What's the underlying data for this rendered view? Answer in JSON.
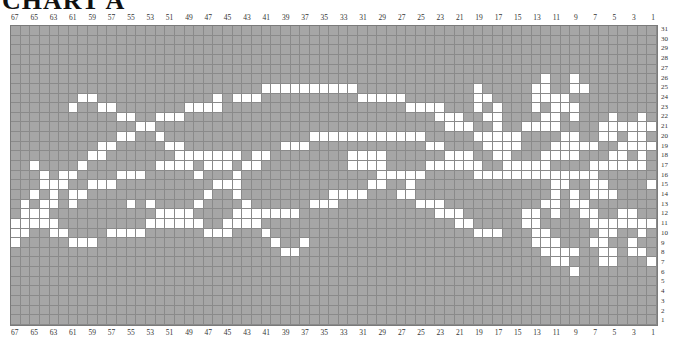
{
  "title": "CHART A",
  "grid": {
    "columns": 67,
    "rows": 31,
    "column_labels": [
      67,
      65,
      63,
      61,
      59,
      57,
      55,
      53,
      51,
      49,
      47,
      45,
      43,
      41,
      39,
      37,
      35,
      33,
      31,
      29,
      27,
      25,
      23,
      21,
      19,
      17,
      15,
      13,
      11,
      9,
      7,
      5,
      3,
      1
    ],
    "row_labels": [
      31,
      30,
      29,
      28,
      27,
      26,
      25,
      24,
      23,
      22,
      21,
      20,
      19,
      18,
      17,
      16,
      15,
      14,
      13,
      12,
      11,
      10,
      9,
      8,
      7,
      6,
      5,
      4,
      3,
      2,
      1
    ],
    "colors": {
      "background": "#a6a6a6",
      "stitch": "#ffffff",
      "gridline": "#8a8a8a"
    },
    "white_cells_by_row": {
      "26": [
        12,
        9
      ],
      "25": [
        41,
        40,
        39,
        38,
        37,
        36,
        35,
        34,
        33,
        32,
        19,
        13,
        12,
        9,
        8
      ],
      "24": [
        60,
        59,
        46,
        44,
        43,
        42,
        31,
        30,
        29,
        28,
        27,
        19,
        18,
        13,
        12,
        11,
        10
      ],
      "23": [
        61,
        58,
        57,
        49,
        48,
        47,
        46,
        26,
        25,
        24,
        23,
        19,
        17,
        13,
        11,
        10,
        9
      ],
      "22": [
        56,
        55,
        52,
        51,
        50,
        23,
        22,
        21,
        18,
        17,
        12,
        11,
        9,
        5,
        2
      ],
      "21": [
        54,
        53,
        22,
        21,
        20,
        17,
        14,
        13,
        12,
        11,
        6,
        5,
        4,
        3,
        2,
        1
      ],
      "20": [
        56,
        55,
        52,
        36,
        35,
        34,
        33,
        32,
        31,
        30,
        29,
        28,
        27,
        26,
        25,
        19,
        18,
        17,
        16,
        15,
        10,
        9,
        6,
        5,
        3,
        2
      ],
      "19": [
        58,
        57,
        51,
        50,
        39,
        38,
        37,
        24,
        23,
        18,
        17,
        16,
        15,
        11,
        10,
        9,
        8,
        7,
        4,
        3,
        2,
        1
      ],
      "18": [
        59,
        58,
        50,
        49,
        48,
        47,
        46,
        45,
        44,
        42,
        41,
        32,
        31,
        30,
        29,
        22,
        21,
        20,
        17,
        16,
        12,
        11,
        10,
        9,
        5,
        4,
        2
      ],
      "17": [
        65,
        60,
        52,
        51,
        50,
        49,
        47,
        46,
        45,
        43,
        42,
        32,
        31,
        30,
        29,
        24,
        23,
        22,
        21,
        20,
        19,
        16,
        15,
        14,
        13,
        12,
        7,
        6,
        5,
        4,
        3,
        2
      ],
      "16": [
        64,
        62,
        61,
        56,
        55,
        54,
        48,
        44,
        29,
        28,
        27,
        26,
        25,
        19,
        18,
        17,
        16,
        15,
        14,
        13,
        12,
        11,
        10,
        9,
        8,
        7
      ],
      "15": [
        64,
        63,
        62,
        59,
        58,
        57,
        46,
        45,
        44,
        30,
        29,
        26,
        11,
        10,
        7,
        6,
        1
      ],
      "14": [
        65,
        63,
        61,
        60,
        47,
        44,
        34,
        33,
        32,
        31,
        27,
        26,
        11,
        9,
        7,
        6,
        5
      ],
      "13": [
        66,
        64,
        63,
        61,
        55,
        53,
        48,
        43,
        36,
        35,
        34,
        25,
        24,
        23,
        12,
        11,
        9,
        8
      ],
      "12": [
        66,
        65,
        64,
        52,
        51,
        50,
        49,
        44,
        43,
        42,
        41,
        40,
        39,
        38,
        23,
        22,
        21,
        14,
        13,
        11,
        8,
        7,
        4,
        3
      ],
      "11": [
        67,
        66,
        65,
        64,
        63,
        53,
        52,
        51,
        50,
        49,
        48,
        45,
        44,
        43,
        42,
        21,
        20,
        14,
        13,
        7,
        6,
        5,
        4,
        3,
        2,
        1
      ],
      "10": [
        67,
        66,
        63,
        62,
        57,
        56,
        55,
        54,
        47,
        46,
        45,
        41,
        19,
        18,
        17,
        13,
        12,
        6,
        5,
        2
      ],
      "9": [
        67,
        61,
        60,
        59,
        40,
        37,
        13,
        12,
        11,
        7,
        6,
        3
      ],
      "8": [
        39,
        38,
        12,
        11,
        10,
        9,
        6,
        5,
        3,
        2
      ],
      "7": [
        11,
        10,
        6,
        5,
        1
      ],
      "6": [
        9
      ]
    }
  }
}
